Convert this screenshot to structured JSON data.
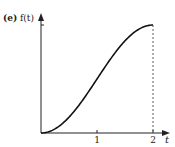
{
  "chart_data": {
    "type": "line",
    "panel_label": "(e)",
    "title": "",
    "xlabel": "t",
    "ylabel": "f(t)",
    "xlim": [
      0,
      2.35
    ],
    "ylim": [
      0,
      1.1
    ],
    "x_ticks": [
      {
        "value": 1,
        "label": "1"
      },
      {
        "value": 2,
        "label": "2"
      }
    ],
    "y_ticks": [
      {
        "value": 1,
        "label": ""
      }
    ],
    "grid": false,
    "legend": "none",
    "series": [
      {
        "name": "f(t)",
        "function": "(1 - cos(pi*t/2))/2",
        "x": [
          0,
          0.25,
          0.5,
          0.75,
          1.0,
          1.25,
          1.5,
          1.75,
          2.0
        ],
        "y": [
          0,
          0.038,
          0.146,
          0.309,
          0.5,
          0.691,
          0.854,
          0.962,
          1.0
        ]
      }
    ],
    "annotations": [
      {
        "type": "dashed-vertical-line",
        "x": 2,
        "from_y": 0,
        "to_y": 1
      }
    ]
  }
}
